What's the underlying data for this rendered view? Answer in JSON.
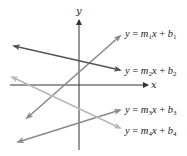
{
  "diagram": {
    "type": "lines-on-axes",
    "axes": {
      "x_label": "x",
      "y_label": "y",
      "origin": [
        79,
        85
      ],
      "x_axis": {
        "from": [
          10,
          85
        ],
        "to": [
          148,
          85
        ]
      },
      "y_axis": {
        "from": [
          79,
          150
        ],
        "to": [
          79,
          20
        ]
      },
      "color": "#333333"
    },
    "lines": [
      {
        "id": "line1",
        "from": [
          27,
          118
        ],
        "to": [
          120,
          36
        ],
        "color": "#8a8a8a",
        "label": {
          "y": "y",
          "eq": "=",
          "m": "m",
          "m_sub": "1",
          "x": "x",
          "plus": "+",
          "b": "b",
          "b_sub": "1"
        },
        "label_pos": [
          125,
          37
        ]
      },
      {
        "id": "line2",
        "from": [
          14,
          46
        ],
        "to": [
          120,
          70
        ],
        "color": "#555555",
        "label": {
          "y": "y",
          "eq": "=",
          "m": "m",
          "m_sub": "2",
          "x": "x",
          "plus": "+",
          "b": "b",
          "b_sub": "2"
        },
        "label_pos": [
          125,
          74
        ]
      },
      {
        "id": "line3",
        "from": [
          18,
          142
        ],
        "to": [
          120,
          110
        ],
        "color": "#8a8a8a",
        "label": {
          "y": "y",
          "eq": "=",
          "m": "m",
          "m_sub": "3",
          "x": "x",
          "plus": "+",
          "b": "b",
          "b_sub": "3"
        },
        "label_pos": [
          125,
          113
        ]
      },
      {
        "id": "line4",
        "from": [
          12,
          77
        ],
        "to": [
          120,
          128
        ],
        "color": "#b8b8b8",
        "label": {
          "y": "y",
          "eq": "=",
          "m": "m",
          "m_sub": "4",
          "x": "x",
          "plus": "+",
          "b": "b",
          "b_sub": "4"
        },
        "label_pos": [
          125,
          134
        ]
      }
    ]
  }
}
